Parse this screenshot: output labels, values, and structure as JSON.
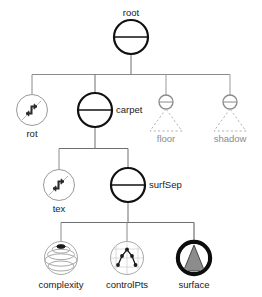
{
  "diagram": {
    "title": "root",
    "type": "scene-graph-tree",
    "colors": {
      "stroke_dark": "#1a1a1a",
      "stroke_mid": "#555555",
      "stroke_light": "#aaaaaa",
      "fill_gray": "#8c8c8c",
      "background": "#ffffff"
    },
    "nodes": [
      {
        "id": "root",
        "label": "root",
        "icon": "separator-circle-icon",
        "style": "bold",
        "label_position": "above",
        "x": 131,
        "y": 37,
        "radius": 17
      },
      {
        "id": "rot",
        "label": "rot",
        "icon": "rotation-zigzag-icon",
        "style": "light",
        "label_position": "below",
        "x": 32,
        "y": 110,
        "radius": 16
      },
      {
        "id": "carpet",
        "label": "carpet",
        "icon": "separator-circle-icon",
        "style": "bold",
        "label_position": "right",
        "x": 95,
        "y": 110,
        "radius": 17
      },
      {
        "id": "floor",
        "label": "floor",
        "icon": "separator-circle-small-icon",
        "style": "light-dashed-subtree",
        "label_position": "below",
        "x": 166,
        "y": 102,
        "radius": 7
      },
      {
        "id": "shadow",
        "label": "shadow",
        "icon": "separator-circle-small-icon",
        "style": "light-dashed-subtree",
        "label_position": "below",
        "x": 230,
        "y": 102,
        "radius": 7
      },
      {
        "id": "tex",
        "label": "tex",
        "icon": "texture-zigzag-icon",
        "style": "light",
        "label_position": "below",
        "x": 59,
        "y": 185,
        "radius": 16
      },
      {
        "id": "surfSep",
        "label": "surfSep",
        "icon": "separator-circle-icon",
        "style": "bold",
        "label_position": "right",
        "x": 128,
        "y": 185,
        "radius": 17
      },
      {
        "id": "complexity",
        "label": "complexity",
        "icon": "sphere-complexity-icon",
        "style": "light",
        "label_position": "below",
        "x": 61,
        "y": 258,
        "radius": 17
      },
      {
        "id": "controlPts",
        "label": "controlPts",
        "icon": "control-points-grid-icon",
        "style": "light",
        "label_position": "below",
        "x": 127,
        "y": 258,
        "radius": 17
      },
      {
        "id": "surface",
        "label": "surface",
        "icon": "surface-cone-icon",
        "style": "bold-filled",
        "label_position": "below",
        "x": 194,
        "y": 258,
        "radius": 18
      }
    ],
    "edges": [
      {
        "from": "root",
        "to": "rot"
      },
      {
        "from": "root",
        "to": "carpet"
      },
      {
        "from": "root",
        "to": "floor"
      },
      {
        "from": "root",
        "to": "shadow"
      },
      {
        "from": "carpet",
        "to": "tex"
      },
      {
        "from": "carpet",
        "to": "surfSep"
      },
      {
        "from": "surfSep",
        "to": "complexity"
      },
      {
        "from": "surfSep",
        "to": "controlPts"
      },
      {
        "from": "surfSep",
        "to": "surface"
      }
    ]
  },
  "labels": {
    "root": "root",
    "rot": "rot",
    "carpet": "carpet",
    "floor": "floor",
    "shadow": "shadow",
    "tex": "tex",
    "surfSep": "surfSep",
    "complexity": "complexity",
    "controlPts": "controlPts",
    "surface": "surface"
  }
}
